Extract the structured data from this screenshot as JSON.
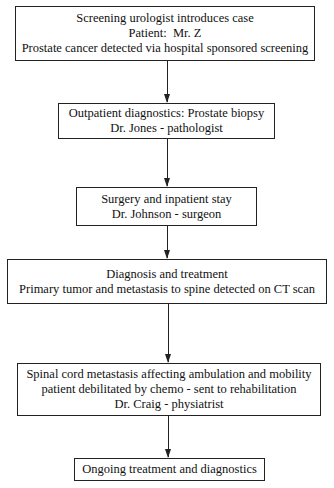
{
  "flowchart": {
    "nodes": [
      {
        "id": "screening",
        "lines": [
          "Screening urologist introduces case",
          "Patient:  Mr. Z",
          "Prostate cancer detected via hospital sponsored screening"
        ]
      },
      {
        "id": "outpatient",
        "lines": [
          "Outpatient diagnostics: Prostate biopsy",
          "Dr. Jones - pathologist"
        ]
      },
      {
        "id": "surgery",
        "lines": [
          "Surgery and inpatient stay",
          "Dr. Johnson - surgeon"
        ]
      },
      {
        "id": "diagnosis",
        "lines": [
          "Diagnosis and treatment",
          "Primary tumor and metastasis to spine detected on CT scan"
        ]
      },
      {
        "id": "rehab",
        "lines": [
          "Spinal cord metastasis affecting ambulation and mobility",
          "patient debilitated by chemo - sent to rehabilitation",
          "Dr. Craig - physiatrist"
        ]
      },
      {
        "id": "ongoing",
        "lines": [
          "Ongoing treatment and diagnostics"
        ]
      }
    ],
    "edges": [
      {
        "from": "screening",
        "to": "outpatient"
      },
      {
        "from": "outpatient",
        "to": "surgery"
      },
      {
        "from": "surgery",
        "to": "diagnosis"
      },
      {
        "from": "diagnosis",
        "to": "rehab"
      },
      {
        "from": "rehab",
        "to": "ongoing"
      }
    ]
  }
}
